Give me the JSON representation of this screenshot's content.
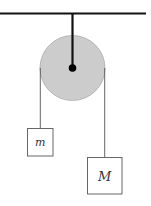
{
  "diagram": {
    "type": "atwood-machine",
    "colors": {
      "line": "#111111",
      "pulley_fill": "#cccccc",
      "pulley_stroke": "#999999",
      "rope": "#555555",
      "box_stroke": "#666666"
    },
    "masses": [
      {
        "id": "small",
        "label": "m"
      },
      {
        "id": "large",
        "label": "M"
      }
    ]
  }
}
